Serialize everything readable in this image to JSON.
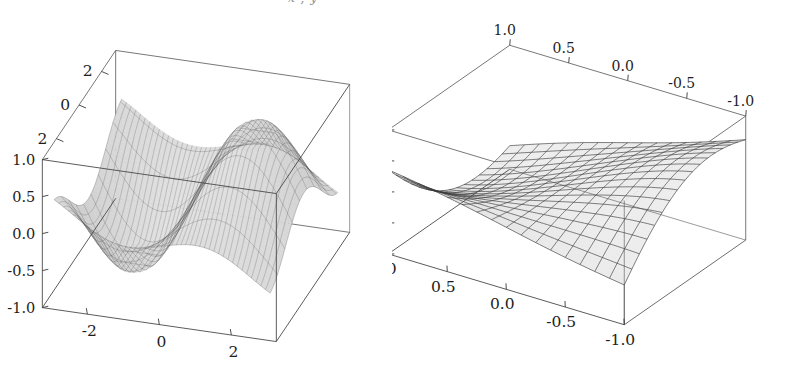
{
  "figure": {
    "background_color": "#ffffff",
    "partial_caption_top": "x , y",
    "panel_count": 2
  },
  "chart_data": [
    {
      "type": "surface3d",
      "name": "left-surface-plot",
      "title": "",
      "xlabel": "",
      "ylabel": "",
      "zlabel": "",
      "xticks": [
        "-2",
        "0",
        "2"
      ],
      "xtick_values": [
        -2,
        0,
        2
      ],
      "yticks": [
        "2",
        "0",
        "2"
      ],
      "ytick_values": [
        -2,
        0,
        2
      ],
      "zticks": [
        "1.0",
        "0.5",
        "0.0",
        "-0.5",
        "-1.0"
      ],
      "ztick_values": [
        1.0,
        0.5,
        0.0,
        -0.5,
        -1.0
      ],
      "xlim": [
        -3.3,
        3.3
      ],
      "ylim": [
        -3.3,
        3.3
      ],
      "zlim": [
        -1.0,
        1.0
      ],
      "grid": true,
      "legend": "none",
      "surface_style": "fine-mesh-grayscale",
      "mesh_u_lines": 44,
      "mesh_v_lines": 10,
      "shading": "grayscale-lighting",
      "description": "Saddle-like twisted surface, sin(x*y)/r type ripple, dark lobe at centre-right"
    },
    {
      "type": "surface3d",
      "name": "right-surface-plot",
      "title": "",
      "xlabel": "",
      "ylabel": "",
      "zlabel": "",
      "xticks_top": [
        "1.0",
        "0.5",
        "0.0",
        "-0.5",
        "-1.0"
      ],
      "xtick_top_values": [
        1.0,
        0.5,
        0.0,
        -0.5,
        -1.0
      ],
      "xticks_bottom": [
        "1.0",
        "0.5",
        "0.0",
        "-0.5",
        "-1.0"
      ],
      "xtick_bottom_values": [
        1.0,
        0.5,
        0.0,
        -0.5,
        -1.0
      ],
      "zticks": [
        "2",
        "1",
        "0",
        "-1",
        "-2"
      ],
      "ztick_values": [
        2,
        1,
        0,
        -1,
        -2
      ],
      "xlim": [
        -1.0,
        1.0
      ],
      "ylim": [
        -1.0,
        1.0
      ],
      "zlim": [
        -2,
        2
      ],
      "grid": true,
      "legend": "none",
      "surface_style": "coarse-mesh-grayscale",
      "mesh_u_lines": 17,
      "mesh_v_lines": 17,
      "shading": "grayscale-lighting",
      "description": "Broad saddle surface with central ridge and trough, coarse square mesh"
    }
  ]
}
